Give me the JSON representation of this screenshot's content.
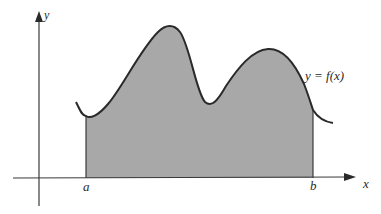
{
  "diagram": {
    "type": "area-under-curve",
    "axes": {
      "x_label": "x",
      "y_label": "y"
    },
    "bounds": {
      "lower_label": "a",
      "upper_label": "b"
    },
    "curve_label": "y = f(x)",
    "colors": {
      "fill": "#a8a8a8",
      "curve": "#2a2a2a",
      "axis": "#3a3a3a",
      "background": "#ffffff"
    }
  }
}
